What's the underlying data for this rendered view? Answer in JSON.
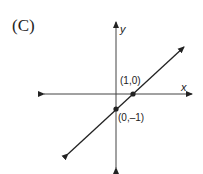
{
  "figure": {
    "option_label": "(C)",
    "x_axis_label": "x",
    "y_axis_label": "y",
    "points": [
      {
        "label": "(1,0)",
        "x": 1,
        "y": 0
      },
      {
        "label": "(0,–1)",
        "x": 0,
        "y": -1
      }
    ],
    "line": {
      "equation": "y = x - 1",
      "slope": 1,
      "y_intercept": -1
    }
  }
}
